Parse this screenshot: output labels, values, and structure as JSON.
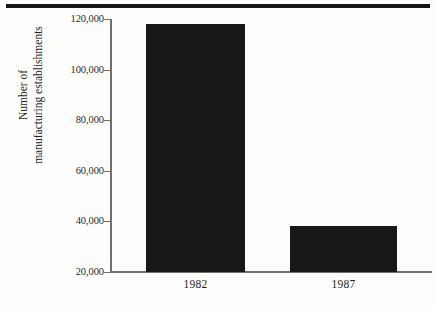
{
  "chart_data": {
    "type": "bar",
    "title": "",
    "subtitle": "",
    "xlabel": "",
    "ylabel": "Number of manufacturing establishments",
    "ylabel_lines": [
      "Number of",
      "manufacturing establishments"
    ],
    "categories": [
      "1982",
      "1987"
    ],
    "values": [
      118000,
      38000
    ],
    "series": [
      {
        "name": "Number of manufacturing establishments",
        "values": [
          118000,
          38000
        ]
      }
    ],
    "ylim": [
      20000,
      120000
    ],
    "y_ticks": [
      20000,
      40000,
      60000,
      80000,
      100000,
      120000
    ],
    "y_tick_labels": [
      "20,000",
      "40,000",
      "60,000",
      "80,000",
      "100,000",
      "120,000"
    ],
    "grid": false,
    "legend": false,
    "legend_position": "none",
    "bar_color": "#17171a",
    "axis_color": "#6f6f70",
    "background_color": "#fdfdfb",
    "orientation": "vertical"
  },
  "decoration": {
    "top_rule_color": "#17171a"
  }
}
